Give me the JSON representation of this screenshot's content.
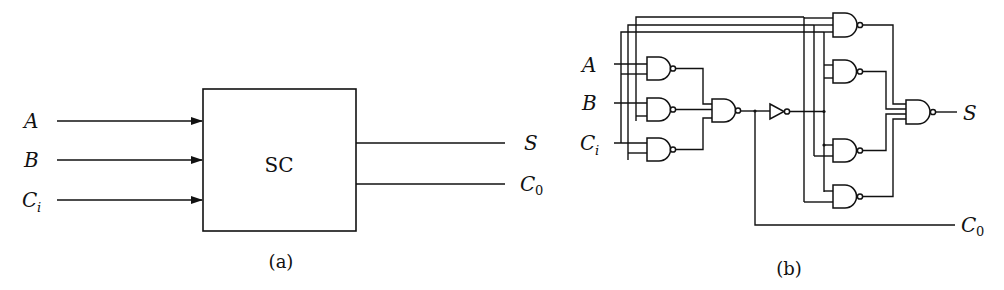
{
  "panel_a": {
    "caption": "(a)",
    "block_label": "SC",
    "inputs": [
      {
        "name": "A",
        "sub": ""
      },
      {
        "name": "B",
        "sub": ""
      },
      {
        "name": "C",
        "sub": "i"
      }
    ],
    "outputs": [
      {
        "name": "S",
        "sub": ""
      },
      {
        "name": "C",
        "sub": "0"
      }
    ]
  },
  "panel_b": {
    "caption": "(b)",
    "inputs": [
      {
        "name": "A",
        "sub": ""
      },
      {
        "name": "B",
        "sub": ""
      },
      {
        "name": "C",
        "sub": "i"
      }
    ],
    "outputs": [
      {
        "name": "S",
        "sub": ""
      },
      {
        "name": "C",
        "sub": "0"
      }
    ],
    "components": {
      "nand_gates_stage1": 3,
      "nand_gates_stage2": 1,
      "inverters": 1,
      "nand_gates_sum_stage": 4,
      "nand_gates_final": 1
    }
  },
  "colors": {
    "ink": "#111111",
    "background": "#ffffff"
  }
}
